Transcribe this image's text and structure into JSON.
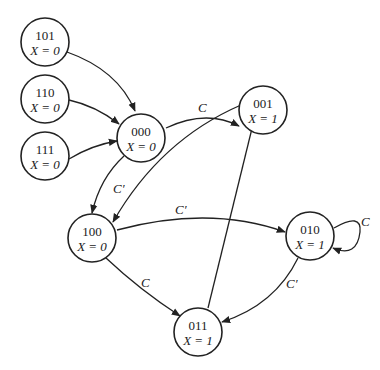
{
  "nodes": [
    {
      "id": "101",
      "state": "101",
      "output": "X = 0",
      "cx": 45,
      "cy": 42
    },
    {
      "id": "110",
      "state": "110",
      "output": "X = 0",
      "cx": 45,
      "cy": 99
    },
    {
      "id": "111",
      "state": "111",
      "output": "X = 0",
      "cx": 45,
      "cy": 156
    },
    {
      "id": "000",
      "state": "000",
      "output": "X = 0",
      "cx": 141,
      "cy": 138
    },
    {
      "id": "001",
      "state": "001",
      "output": "X = 1",
      "cx": 263,
      "cy": 88
    },
    {
      "id": "100",
      "state": "100",
      "output": "X = 0",
      "cx": 92,
      "cy": 238
    },
    {
      "id": "010",
      "state": "010",
      "output": "X = 1",
      "cx": 310,
      "cy": 236
    },
    {
      "id": "011",
      "state": "011",
      "output": "X = 1",
      "cx": 198,
      "cy": 332
    }
  ],
  "edges": [
    {
      "from": "101",
      "to": "000",
      "label": ""
    },
    {
      "from": "110",
      "to": "000",
      "label": ""
    },
    {
      "from": "111",
      "to": "000",
      "label": ""
    },
    {
      "from": "000",
      "to": "001",
      "label": "C"
    },
    {
      "from": "000",
      "to": "100",
      "label": "C'"
    },
    {
      "from": "001",
      "to": "100",
      "label": ""
    },
    {
      "from": "100",
      "to": "010",
      "label": "C'"
    },
    {
      "from": "100",
      "to": "011",
      "label": "C"
    },
    {
      "from": "010",
      "to": "010",
      "label": "C"
    },
    {
      "from": "010",
      "to": "011",
      "label": "C'"
    },
    {
      "from": "011",
      "to": "001",
      "label": ""
    }
  ],
  "labels": {
    "e_000_001": "C",
    "e_000_100": "C′",
    "e_100_010": "C′",
    "e_100_011": "C",
    "e_010_self": "C",
    "e_010_011": "C′"
  }
}
